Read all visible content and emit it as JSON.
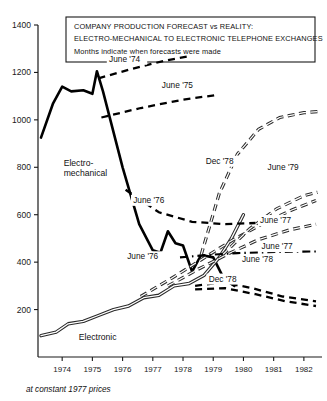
{
  "chart_data": {
    "type": "line",
    "title": "COMPANY PRODUCTION FORECAST vs REALITY:",
    "subtitle": "ELECTRO-MECHANICAL TO ELECTRONIC TELEPHONE EXCHANGES",
    "caption": "Months indicate when forecasts were made",
    "footnote": "at constant 1977 prices",
    "xlabel": "",
    "ylabel": "",
    "xlim": [
      1973.2,
      1982.6
    ],
    "ylim": [
      0,
      1400
    ],
    "grid": false,
    "legend_position": "inline-annotations",
    "xticks": [
      "1974",
      "1975",
      "1976",
      "1977",
      "1978",
      "1979",
      "1980",
      "1981",
      "1982"
    ],
    "xtick_values": [
      1974,
      1975,
      1976,
      1977,
      1978,
      1979,
      1980,
      1981,
      1982
    ],
    "yticks": [
      "200",
      "400",
      "600",
      "800",
      "1000",
      "1200",
      "1400"
    ],
    "ytick_values": [
      200,
      400,
      600,
      800,
      1000,
      1200,
      1400
    ],
    "series": [
      {
        "name": "Electro-mechanical",
        "style": "solid",
        "kind": "actual",
        "x": [
          1973.3,
          1973.7,
          1974.0,
          1974.3,
          1974.7,
          1975.0,
          1975.15,
          1975.35,
          1976.0,
          1976.55,
          1977.0,
          1977.25,
          1977.5,
          1977.75,
          1978.0,
          1978.3,
          1978.6,
          1979.0,
          1979.35,
          1979.7
        ],
        "values": [
          925,
          1070,
          1140,
          1120,
          1125,
          1110,
          1205,
          1120,
          800,
          560,
          450,
          440,
          530,
          480,
          470,
          360,
          430,
          420,
          330,
          300
        ]
      },
      {
        "name": "Electronic",
        "style": "double-solid",
        "kind": "actual",
        "x": [
          1973.3,
          1973.8,
          1974.2,
          1974.7,
          1975.2,
          1975.7,
          1976.2,
          1976.7,
          1977.2,
          1977.7,
          1978.2,
          1978.7,
          1979.2,
          1979.6,
          1980.0
        ],
        "values": [
          90,
          105,
          140,
          150,
          175,
          200,
          215,
          250,
          260,
          300,
          310,
          345,
          420,
          500,
          600
        ]
      },
      {
        "name": "June '74",
        "style": "dashed",
        "kind": "forecast",
        "label": "June '74",
        "label_x": 1975.55,
        "label_y": 1245,
        "x": [
          1975.2,
          1976.3,
          1977.4,
          1978.2
        ],
        "values": [
          1175,
          1215,
          1250,
          1268
        ]
      },
      {
        "name": "June '75",
        "style": "dashed",
        "kind": "forecast",
        "label": "June '75",
        "label_x": 1977.3,
        "label_y": 1135,
        "x": [
          1975.3,
          1976.6,
          1978.0,
          1979.1
        ],
        "values": [
          1010,
          1050,
          1085,
          1105
        ]
      },
      {
        "name": "June '76 (upper)",
        "style": "dashed",
        "kind": "forecast",
        "label": "June '76",
        "label_x": 1976.35,
        "label_y": 650,
        "x": [
          1976.1,
          1977.2,
          1978.3,
          1979.4,
          1980.4
        ],
        "values": [
          705,
          610,
          570,
          560,
          565
        ]
      },
      {
        "name": "June '76 (lower)",
        "style": "double-dashed",
        "kind": "forecast",
        "label": "June '76",
        "label_x": 1976.15,
        "label_y": 412,
        "x": [
          1976.6,
          1977.6,
          1978.6,
          1979.6,
          1980.6,
          1981.6,
          1982.4
        ],
        "values": [
          255,
          330,
          410,
          490,
          560,
          620,
          660
        ]
      },
      {
        "name": "Dec '78 (upper)",
        "style": "double-dashed",
        "kind": "forecast",
        "label": "Dec '78",
        "label_x": 1978.75,
        "label_y": 815,
        "x": [
          1978.6,
          1979.2,
          1979.8,
          1980.5,
          1981.2,
          1982.0,
          1982.45
        ],
        "values": [
          430,
          690,
          855,
          960,
          1010,
          1030,
          1035
        ]
      },
      {
        "name": "June '79",
        "style": "double-dashed",
        "kind": "forecast",
        "label": "June '79",
        "label_x": 1980.8,
        "label_y": 790,
        "x": [
          1979.3,
          1980.2,
          1981.1,
          1982.0,
          1982.45
        ],
        "values": [
          430,
          540,
          625,
          680,
          695
        ]
      },
      {
        "name": "June '77 (upper)",
        "style": "double-dashed",
        "kind": "forecast",
        "label": "June '77",
        "label_x": 1980.55,
        "label_y": 565,
        "x": [
          1977.5,
          1978.5,
          1979.5,
          1980.5,
          1981.5,
          1982.4
        ],
        "values": [
          300,
          370,
          435,
          495,
          535,
          560
        ]
      },
      {
        "name": "June '77 (lower)",
        "style": "dash-dot",
        "kind": "forecast",
        "label": "June '77",
        "label_x": 1980.6,
        "label_y": 455,
        "x": [
          1977.9,
          1978.8,
          1979.8,
          1980.8,
          1981.8,
          1982.4
        ],
        "values": [
          420,
          430,
          438,
          442,
          444,
          445
        ]
      },
      {
        "name": "June '78",
        "style": "dashed",
        "kind": "forecast",
        "label": "June '78",
        "label_x": 1979.95,
        "label_y": 400,
        "x": [
          1978.4,
          1979.3,
          1980.3,
          1981.3,
          1982.4
        ],
        "values": [
          300,
          315,
          290,
          255,
          235
        ]
      },
      {
        "name": "Dec '78 (lower)",
        "style": "dashed",
        "kind": "forecast",
        "label": "Dec '78",
        "label_x": 1978.85,
        "label_y": 318,
        "x": [
          1978.4,
          1979.4,
          1980.4,
          1981.4,
          1982.4
        ],
        "values": [
          285,
          290,
          265,
          235,
          215
        ]
      }
    ],
    "series_labels": [
      {
        "text": "Electro-",
        "x": 1974.05,
        "y": 805
      },
      {
        "text": "mechanical",
        "x": 1974.05,
        "y": 762
      },
      {
        "text": "Electronic",
        "x": 1974.55,
        "y": 72
      }
    ]
  }
}
